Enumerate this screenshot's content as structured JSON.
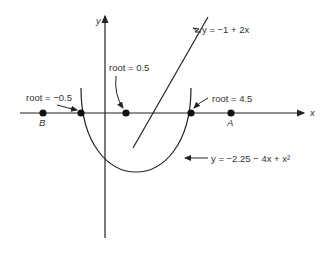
{
  "diagram": {
    "axes": {
      "x_label": "x",
      "y_label": "y"
    },
    "points": [
      {
        "label": "B"
      },
      {
        "label": "A"
      }
    ],
    "roots": [
      {
        "label": "root = −0.5"
      },
      {
        "label": "root = 0.5"
      },
      {
        "label": "root = 4.5"
      }
    ],
    "curves": {
      "line_label": "y = −1 + 2x",
      "parabola_label": "y = −2.25 − 4x + x²"
    },
    "colors": {
      "ink": "#222222",
      "text": "#333333",
      "background": "#ffffff"
    }
  }
}
